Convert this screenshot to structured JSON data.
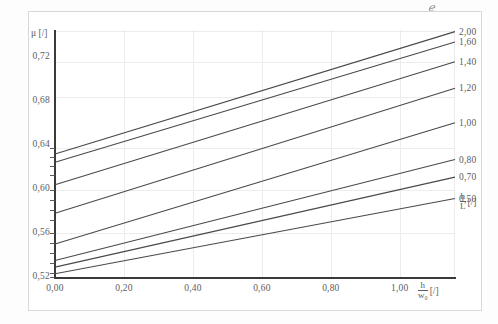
{
  "figure": {
    "speck_mark": "ℯ",
    "axis_title_y": "μ [/]",
    "axis_title_x_num": "h",
    "axis_title_x_den": "w₀",
    "axis_title_x_unit": "[/]",
    "legend_title_num": "h",
    "legend_title_den": "L",
    "legend_title_unit": "[/]"
  },
  "chart_data": {
    "type": "line",
    "title": "",
    "xlabel": "h/w0 [/]",
    "ylabel": "μ [/]",
    "xlim": [
      0.0,
      1.16
    ],
    "ylim": [
      0.52,
      0.745
    ],
    "grid": true,
    "legend_position": "right",
    "xticks": [
      "0,00",
      "0,20",
      "0,40",
      "0,60",
      "0,80",
      "1,00"
    ],
    "xtick_values": [
      0.0,
      0.2,
      0.4,
      0.6,
      0.8,
      1.0
    ],
    "yticks": [
      "0,72",
      "0,68",
      "0,64",
      "0,60",
      "0,56",
      "0,52"
    ],
    "ytick_values": [
      0.72,
      0.68,
      0.64,
      0.6,
      0.56,
      0.52
    ],
    "series": [
      {
        "name": "2,00",
        "x": [
          0.0,
          1.16
        ],
        "values": [
          0.632,
          0.7435
        ]
      },
      {
        "name": "1,60",
        "x": [
          0.0,
          1.16
        ],
        "values": [
          0.6245,
          0.734
        ]
      },
      {
        "name": "1,40",
        "x": [
          0.0,
          1.16
        ],
        "values": [
          0.604,
          0.716
        ]
      },
      {
        "name": "1,20",
        "x": [
          0.0,
          1.16
        ],
        "values": [
          0.578,
          0.692
        ]
      },
      {
        "name": "1,00",
        "x": [
          0.0,
          1.16
        ],
        "values": [
          0.55,
          0.6605
        ]
      },
      {
        "name": "0,80",
        "x": [
          0.0,
          1.16
        ],
        "values": [
          0.535,
          0.627
        ]
      },
      {
        "name": "0,70",
        "x": [
          0.0,
          1.16
        ],
        "values": [
          0.529,
          0.611
        ]
      },
      {
        "name": "0,50",
        "x": [
          0.0,
          1.16
        ],
        "values": [
          0.523,
          0.5915
        ]
      }
    ]
  }
}
